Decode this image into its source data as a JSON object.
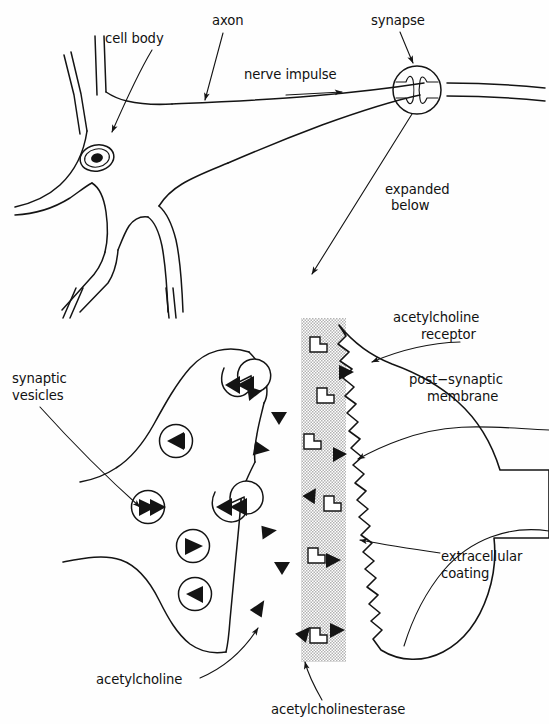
{
  "figure": {
    "width": 549,
    "height": 724,
    "background_color": "#ffffff",
    "ink_color": "#141414",
    "stipple_color": "#b9b9b9"
  },
  "upper_panel": {
    "name": "whole neuron overview",
    "labels": {
      "cell_body": "cell body",
      "axon": "axon",
      "nerve_impulse": "nerve impulse",
      "synapse": "synapse",
      "expanded_below": "expanded\nbelow",
      "expanded_below_line1": "expanded",
      "expanded_below_line2": "below"
    }
  },
  "lower_panel": {
    "name": "expanded synapse detail",
    "labels": {
      "synaptic_vesicles_line1": "synaptic",
      "synaptic_vesicles_line2": "vesicles",
      "acetylcholine": "acetylcholine",
      "acetylcholinesterase": "acetylcholinesterase",
      "acetylcholine_receptor_line1": "acetylcholine",
      "acetylcholine_receptor_line2": "receptor",
      "post_synaptic_membrane_line1": "post−synaptic",
      "post_synaptic_membrane_line2": "membrane",
      "extracellular_coating_line1": "extracellular",
      "extracellular_coating_line2": "coating"
    },
    "counts": {
      "vesicles_internal": 4,
      "vesicles_fused": 2,
      "free_acetylcholine": 8,
      "enzymes_in_cleft": 6,
      "bound_acetylcholine": 4
    }
  }
}
